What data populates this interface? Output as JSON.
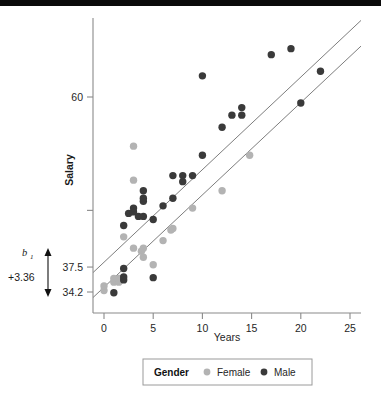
{
  "chart_data": {
    "type": "scatter",
    "title": "",
    "xlabel": "Years",
    "ylabel": "Salary",
    "xlim": [
      -1.5,
      26.5
    ],
    "ylim": [
      32.6,
      70.5
    ],
    "xticks": [
      0,
      5,
      10,
      15,
      20,
      25
    ],
    "xticklabels": [
      "0",
      "5",
      "10",
      "15",
      "20",
      "25"
    ],
    "yticks": [
      34.2,
      37.5,
      45.0,
      60.0
    ],
    "yticklabels": [
      "34.2",
      "37.5",
      "",
      "60"
    ],
    "grid": false,
    "legend_position": "bottom",
    "legend_title": "Gender",
    "series": [
      {
        "name": "Female",
        "color": "#b3b3b3",
        "marker": "circle",
        "points": [
          [
            0.0,
            34.4
          ],
          [
            0.0,
            35.0
          ],
          [
            1.0,
            35.5
          ],
          [
            1.0,
            36.0
          ],
          [
            1.5,
            35.5
          ],
          [
            1.5,
            36.0
          ],
          [
            2.0,
            41.5
          ],
          [
            3.0,
            40.0
          ],
          [
            3.0,
            49.0
          ],
          [
            3.0,
            53.5
          ],
          [
            3.8,
            39.6
          ],
          [
            4.0,
            38.8
          ],
          [
            4.0,
            40.0
          ],
          [
            5.0,
            37.8
          ],
          [
            6.0,
            41.0
          ],
          [
            6.8,
            42.4
          ],
          [
            7.0,
            42.6
          ],
          [
            9.0,
            45.3
          ],
          [
            12.0,
            47.6
          ],
          [
            14.8,
            52.3
          ]
        ]
      },
      {
        "name": "Male",
        "color": "#3a3a3a",
        "marker": "circle",
        "points": [
          [
            1.0,
            34.1
          ],
          [
            2.0,
            37.3
          ],
          [
            2.0,
            35.8
          ],
          [
            2.0,
            36.2
          ],
          [
            2.0,
            43.0
          ],
          [
            2.5,
            44.6
          ],
          [
            3.0,
            44.8
          ],
          [
            3.0,
            45.3
          ],
          [
            3.5,
            44.2
          ],
          [
            4.0,
            44.2
          ],
          [
            4.0,
            46.2
          ],
          [
            4.0,
            46.6
          ],
          [
            4.0,
            47.6
          ],
          [
            5.0,
            36.1
          ],
          [
            5.0,
            43.8
          ],
          [
            6.0,
            45.6
          ],
          [
            7.0,
            46.6
          ],
          [
            7.0,
            49.6
          ],
          [
            8.0,
            48.8
          ],
          [
            8.0,
            49.6
          ],
          [
            9.0,
            49.6
          ],
          [
            10.0,
            52.3
          ],
          [
            10.0,
            62.8
          ],
          [
            12.0,
            56.0
          ],
          [
            13.0,
            57.6
          ],
          [
            14.0,
            57.6
          ],
          [
            14.0,
            58.6
          ],
          [
            17.0,
            65.6
          ],
          [
            19.0,
            66.4
          ],
          [
            20.0,
            59.2
          ],
          [
            22.0,
            63.4
          ]
        ]
      }
    ],
    "fit_lines": [
      {
        "name": "male-fit-line",
        "x0": -1.5,
        "y0": 36.3,
        "x1": 26.5,
        "y1": 70.6
      },
      {
        "name": "female-fit-line",
        "x0": -1.5,
        "y0": 33.0,
        "x1": 26.5,
        "y1": 67.2
      }
    ],
    "annotations": [
      {
        "name": "slope-coefficient",
        "text": "b",
        "subscript": "1"
      },
      {
        "name": "slope-value",
        "text": "+3.36"
      },
      {
        "name": "intercept-gap-arrow",
        "from_y": 37.5,
        "to_y": 34.2
      }
    ]
  },
  "legend": {
    "title": "Gender",
    "entries": [
      {
        "label": "Female",
        "color": "#b3b3b3"
      },
      {
        "label": "Male",
        "color": "#3a3a3a"
      }
    ]
  },
  "axes": {
    "x_title": "Years",
    "y_title": "Salary"
  }
}
